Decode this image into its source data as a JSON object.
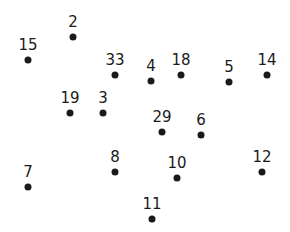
{
  "puzzle": {
    "type": "connect-the-dots",
    "points": [
      {
        "label": "2",
        "x": 73,
        "y": 37
      },
      {
        "label": "15",
        "x": 28,
        "y": 60
      },
      {
        "label": "33",
        "x": 115,
        "y": 75
      },
      {
        "label": "4",
        "x": 151,
        "y": 81
      },
      {
        "label": "18",
        "x": 181,
        "y": 75
      },
      {
        "label": "5",
        "x": 229,
        "y": 82
      },
      {
        "label": "14",
        "x": 267,
        "y": 75
      },
      {
        "label": "19",
        "x": 70,
        "y": 113
      },
      {
        "label": "3",
        "x": 103,
        "y": 113
      },
      {
        "label": "29",
        "x": 162,
        "y": 132
      },
      {
        "label": "6",
        "x": 201,
        "y": 135
      },
      {
        "label": "8",
        "x": 115,
        "y": 172
      },
      {
        "label": "10",
        "x": 177,
        "y": 178
      },
      {
        "label": "12",
        "x": 262,
        "y": 172
      },
      {
        "label": "7",
        "x": 28,
        "y": 187
      },
      {
        "label": "11",
        "x": 152,
        "y": 219
      }
    ]
  }
}
